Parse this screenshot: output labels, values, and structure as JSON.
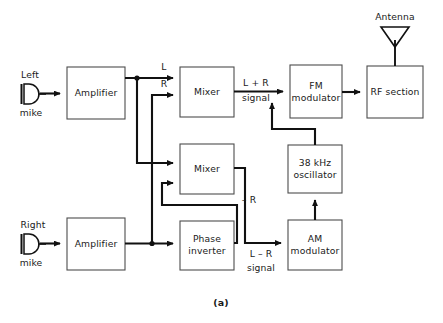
{
  "figure": {
    "caption": "(a)",
    "type": "stereo-fm-transmitter-block-diagram"
  },
  "blocks": [
    {
      "id": "amp_left",
      "label": "Amplifier",
      "x": 67,
      "y": 67,
      "w": 58,
      "h": 52
    },
    {
      "id": "mixer_top",
      "label": "Mixer",
      "x": 180,
      "y": 67,
      "w": 54,
      "h": 50
    },
    {
      "id": "fm_mod",
      "label": "FM\nmodulator",
      "x": 290,
      "y": 65,
      "w": 52,
      "h": 53
    },
    {
      "id": "rf_sect",
      "label": "RF section",
      "x": 367,
      "y": 66,
      "w": 56,
      "h": 52
    },
    {
      "id": "mixer_bot",
      "label": "Mixer",
      "x": 180,
      "y": 144,
      "w": 54,
      "h": 50
    },
    {
      "id": "osc_38k",
      "label": "38 kHz\noscillator",
      "x": 288,
      "y": 145,
      "w": 54,
      "h": 48
    },
    {
      "id": "amp_right",
      "label": "Amplifier",
      "x": 67,
      "y": 218,
      "w": 58,
      "h": 52
    },
    {
      "id": "phase_inv",
      "label": "Phase\ninverter",
      "x": 180,
      "y": 221,
      "w": 54,
      "h": 49
    },
    {
      "id": "am_mod",
      "label": "AM\nmodulator",
      "x": 288,
      "y": 220,
      "w": 54,
      "h": 50
    }
  ],
  "block_labels": {
    "amp_left": "Amplifier",
    "mixer_top": "Mixer",
    "fm_mod_line1": "FM",
    "fm_mod_line2": "modulator",
    "rf_sect": "RF section",
    "mixer_bot": "Mixer",
    "osc_line1": "38 kHz",
    "osc_line2": "oscillator",
    "amp_right": "Amplifier",
    "phase_line1": "Phase",
    "phase_line2": "inverter",
    "am_line1": "AM",
    "am_line2": "modulator"
  },
  "inputs": {
    "left_mike_top": "Left",
    "left_mike_bottom": "mike",
    "right_mike_top": "Right",
    "right_mike_bottom": "mike"
  },
  "output": {
    "antenna": "Antenna"
  },
  "signal_labels": {
    "l": "L",
    "r": "R",
    "minus_r": "– R",
    "lplusr_line1": "L + R",
    "lplusr_line2": "signal",
    "lminusr_line1": "L – R",
    "lminusr_line2": "signal"
  },
  "colors": {
    "wire": "#111111",
    "block_border": "#4d4d4d",
    "background": "#ffffff",
    "text": "#1a1a1a"
  }
}
